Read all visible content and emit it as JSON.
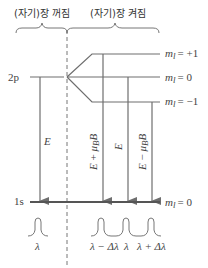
{
  "header": {
    "field_off_label": "(자기)장 꺼짐",
    "field_on_label": "(자기)장 켜짐"
  },
  "levels": {
    "upper": {
      "label": "2p"
    },
    "lower": {
      "label": "1s",
      "ml": "m_l = 0"
    },
    "sublevels": [
      {
        "name": "ml-plus-1",
        "m": "m",
        "sub": "l",
        "value": "= +1"
      },
      {
        "name": "ml-0",
        "m": "m",
        "sub": "l",
        "value": "= 0"
      },
      {
        "name": "ml-minus-1",
        "m": "m",
        "sub": "l",
        "value": "= −1"
      }
    ],
    "ground_sub": {
      "m": "m",
      "sub": "l",
      "value": "= 0"
    }
  },
  "transitions": [
    {
      "name": "no-field",
      "label": "E"
    },
    {
      "name": "plus",
      "label_main": "E + μ",
      "label_sub": "B",
      "label_end": "B"
    },
    {
      "name": "zero",
      "label": "E"
    },
    {
      "name": "minus",
      "label_main": "E − μ",
      "label_sub": "B",
      "label_end": "B"
    }
  ],
  "spectra": {
    "no_field": [
      "λ"
    ],
    "field_on": [
      "λ − Δλ",
      "λ",
      "λ + Δλ"
    ]
  },
  "colors": {
    "line": "#6e6e6e",
    "dark_line": "#555555",
    "text": "#444444"
  }
}
